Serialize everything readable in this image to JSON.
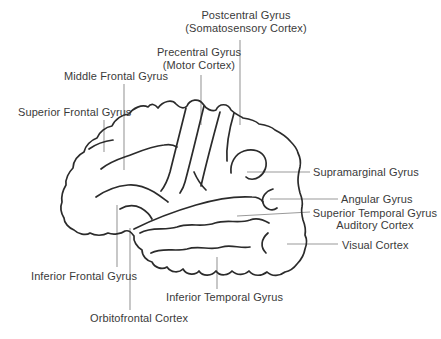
{
  "figure": {
    "background": "#ffffff",
    "outline_color": "#2b2b2b",
    "leader_color": "#9a9a9a",
    "text_color": "#3a3a3a"
  },
  "labels": {
    "postcentral": {
      "line1": "Postcentral Gyrus",
      "line2": "(Somatosensory Cortex)"
    },
    "precentral": {
      "line1": "Precentral Gyrus",
      "line2": "(Motor Cortex)"
    },
    "middle_frontal": {
      "text": "Middle Frontal Gyrus"
    },
    "superior_frontal": {
      "text": "Superior Frontal Gyrus"
    },
    "supramarginal": {
      "text": "Supramarginal Gyrus"
    },
    "angular": {
      "text": "Angular Gyrus"
    },
    "superior_temporal": {
      "line1": "Superior Temporal Gyrus",
      "line2": "Auditory Cortex"
    },
    "visual": {
      "text": "Visual Cortex"
    },
    "inferior_frontal": {
      "text": "Inferior Frontal Gyrus"
    },
    "inferior_temporal": {
      "text": "Inferior Temporal Gyrus"
    },
    "orbitofrontal": {
      "text": "Orbitofrontal Cortex"
    }
  }
}
